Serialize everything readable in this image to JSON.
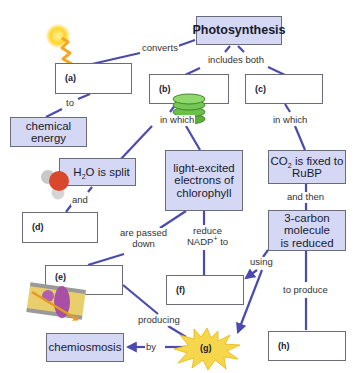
{
  "diagram": {
    "type": "concept-map",
    "central_concept": "Photosynthesis",
    "colors": {
      "line": "#4a4ab0",
      "filled_box": "#d4d8f4",
      "blank_box": "#ffffff",
      "box_border": "#6b6b7a",
      "starburst": "#f6d64a"
    },
    "nodes": {
      "photosynthesis": "Photosynthesis",
      "a": "(a)",
      "b": "(b)",
      "c": "(c)",
      "chemical_energy_1": "chemical",
      "chemical_energy_2": "energy",
      "h2o_pre": "H",
      "h2o_sub": "2",
      "h2o_post": "O is split",
      "d": "(d)",
      "light_1": "light-excited",
      "light_2": "electrons of",
      "light_3": "chlorophyll",
      "co2_pre": "CO",
      "co2_sub": "2",
      "co2_post": " is fixed to",
      "co2_2": "RuBP",
      "carbon_1": "3-carbon",
      "carbon_2": "molecule",
      "carbon_3": "is reduced",
      "e": "(e)",
      "f": "(f)",
      "g": "(g)",
      "h": "(h)",
      "chemiosmosis": "chemiosmosis"
    },
    "links": {
      "converts": "converts",
      "to": "to",
      "includes_both": "includes both",
      "in_which_b": "in which",
      "in_which_c": "in which",
      "and": "and",
      "are_passed_1": "are passed",
      "are_passed_2": "down",
      "reduce_1": "reduce",
      "reduce_2_pre": "NADP",
      "reduce_2_sup": "+",
      "reduce_2_post": " to",
      "and_then": "and then",
      "using": "using",
      "to_produce": "to produce",
      "producing": "producing",
      "by": "by"
    },
    "icons": [
      "sun-icon",
      "light-wave-icon",
      "thylakoid-stack-icon",
      "water-molecule-icon",
      "membrane-protein-icon",
      "starburst-icon"
    ]
  }
}
